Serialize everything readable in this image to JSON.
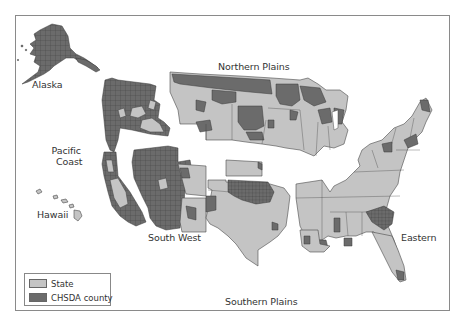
{
  "map": {
    "regions": [
      {
        "id": "alaska",
        "label": "Alaska"
      },
      {
        "id": "pacific-coast",
        "label": "Pacific\nCoast",
        "line1": "Pacific",
        "line2": "Coast"
      },
      {
        "id": "hawaii",
        "label": "Hawaii"
      },
      {
        "id": "northern-plains",
        "label": "Northern Plains"
      },
      {
        "id": "south-west",
        "label": "South West"
      },
      {
        "id": "southern-plains",
        "label": "Southern Plains"
      },
      {
        "id": "eastern",
        "label": "Eastern"
      }
    ],
    "colors": {
      "state": "#c4c4c4",
      "chsda_county": "#6b6b6b",
      "border": "#4a4a4a",
      "frame": "#8a8a8a"
    }
  },
  "legend": {
    "items": [
      {
        "label": "State",
        "color": "#c4c4c4"
      },
      {
        "label": "CHSDA county",
        "color": "#6b6b6b"
      }
    ]
  }
}
